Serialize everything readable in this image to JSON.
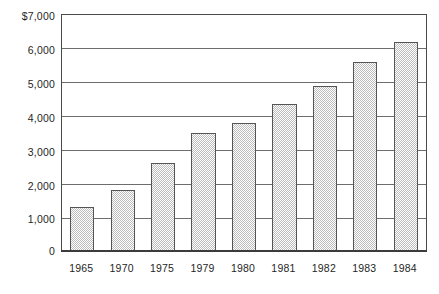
{
  "chart_data": {
    "type": "bar",
    "title": "",
    "subtitle": "",
    "xlabel": "",
    "ylabel": "",
    "categories": [
      "1965",
      "1970",
      "1975",
      "1979",
      "1980",
      "1981",
      "1982",
      "1983",
      "1984"
    ],
    "values": [
      1300,
      1800,
      2600,
      3500,
      3800,
      4350,
      4900,
      5600,
      6200
    ],
    "ylim": [
      0,
      7000
    ],
    "y_ticks": [
      0,
      1000,
      2000,
      3000,
      4000,
      5000,
      6000,
      7000
    ],
    "y_tick_labels": [
      "0",
      "1,000",
      "2,000",
      "3,000",
      "4,000",
      "5,000",
      "6,000",
      "$7,000"
    ],
    "grid": true,
    "grid_axis": "y",
    "legend": false,
    "legend_position": "none",
    "bar_fill": "#bdbdbd",
    "bar_fill_pattern": "50% checkerboard dither",
    "bar_edge_color": "#555555",
    "axis_color": "#4a4a4a",
    "background": "#ffffff",
    "currency_symbol": "$",
    "series": [
      {
        "name": "",
        "values": [
          1300,
          1800,
          2600,
          3500,
          3800,
          4350,
          4900,
          5600,
          6200
        ]
      }
    ]
  },
  "axis": {
    "y": {
      "tick_7000": "$7,000",
      "tick_6000": "6,000",
      "tick_5000": "5,000",
      "tick_4000": "4,000",
      "tick_3000": "3,000",
      "tick_2000": "2,000",
      "tick_1000": "1,000",
      "tick_0": "0"
    }
  }
}
